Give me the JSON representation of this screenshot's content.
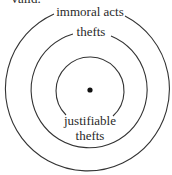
{
  "header": {
    "cut_text": "Valid."
  },
  "diagram": {
    "type": "concentric-circles",
    "center": [
      90,
      90
    ],
    "circles": [
      {
        "name": "outer",
        "label": "immoral acts",
        "radius": 82
      },
      {
        "name": "middle",
        "label": "thefts",
        "radius": 58
      },
      {
        "name": "inner",
        "label_line1": "justifiable",
        "label_line2": "thefts",
        "radius": 34
      }
    ],
    "stroke_color": "#333333",
    "point": {
      "label": ""
    }
  }
}
